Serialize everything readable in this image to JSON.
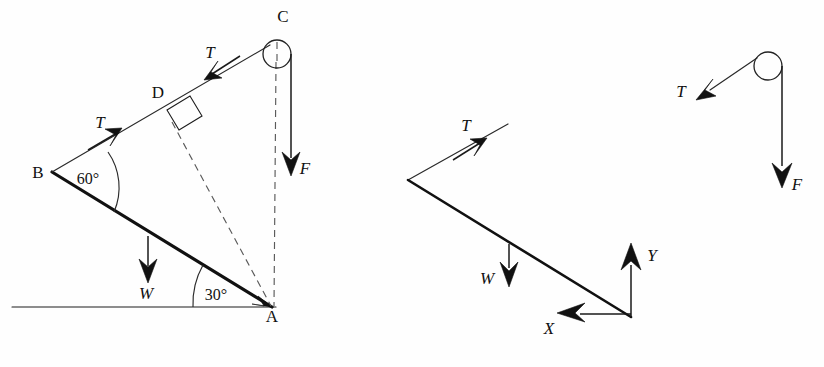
{
  "figure": {
    "background_color": "#fefefe",
    "ink_color": "#111111",
    "dashed_color": "#5a5a5a"
  },
  "panels": [
    {
      "id": "panel-main-geometry",
      "name": "inclined-beam-geometry",
      "points": [
        {
          "key": "A",
          "label": "A",
          "x": 272,
          "y": 307
        },
        {
          "key": "B",
          "label": "B",
          "x": 52,
          "y": 172
        },
        {
          "key": "C",
          "label": "C",
          "x": 276,
          "y": 47
        },
        {
          "key": "D",
          "label": "D",
          "x": 172,
          "y": 120
        }
      ],
      "angles": [
        {
          "key": "angle-B",
          "label": "60°",
          "value": 60,
          "at": "B",
          "x": 88,
          "y": 178
        },
        {
          "key": "angle-A",
          "label": "30°",
          "value": 30,
          "at": "A",
          "x": 212,
          "y": 295
        }
      ],
      "forces": [
        {
          "key": "T-lower",
          "label": "T",
          "x": 100,
          "y": 124
        },
        {
          "key": "T-upper",
          "label": "T",
          "x": 210,
          "y": 55
        },
        {
          "key": "W",
          "label": "W",
          "x": 143,
          "y": 295
        },
        {
          "key": "F",
          "label": "F",
          "x": 302,
          "y": 170
        }
      ],
      "pulley": {
        "key": "pulley-C",
        "cx": 277,
        "cy": 54,
        "r": 14
      },
      "right_angle_marker": {
        "key": "right-angle-D",
        "at": "D"
      },
      "ground_line": {
        "key": "ground-line",
        "x1": 12,
        "y1": 307,
        "x2": 272,
        "y2": 307
      }
    },
    {
      "id": "panel-free-body",
      "name": "free-body-diagram",
      "forces": [
        {
          "key": "T",
          "label": "T",
          "x": 466,
          "y": 127
        },
        {
          "key": "W",
          "label": "W",
          "x": 487,
          "y": 280
        },
        {
          "key": "X",
          "label": "X",
          "x": 549,
          "y": 330
        },
        {
          "key": "Y",
          "label": "Y",
          "x": 651,
          "y": 256
        }
      ],
      "axes": {
        "origin_x": 631,
        "origin_y": 317
      }
    },
    {
      "id": "panel-pulley-detail",
      "name": "pulley-detail",
      "forces": [
        {
          "key": "T",
          "label": "T",
          "x": 681,
          "y": 93
        },
        {
          "key": "F",
          "label": "F",
          "x": 795,
          "y": 186
        }
      ],
      "pulley": {
        "key": "pulley-right",
        "cx": 768,
        "cy": 66,
        "r": 14
      }
    }
  ]
}
